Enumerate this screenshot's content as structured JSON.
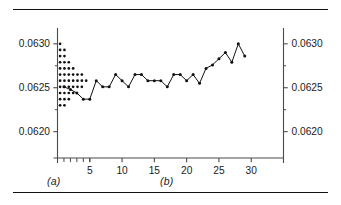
{
  "figure": {
    "panels": [
      {
        "id": "a",
        "label": "(a)",
        "type": "dotplot"
      },
      {
        "id": "b",
        "label": "(b)",
        "type": "line"
      }
    ]
  },
  "axes": {
    "left": {
      "tick_labels": [
        "0.0630",
        "0.0625",
        "0.0620"
      ],
      "tick_values": [
        0.063,
        0.0625,
        0.062
      ]
    },
    "right": {
      "tick_labels": [
        "0.0630",
        "0.0625",
        "0.0620"
      ],
      "tick_values": [
        0.063,
        0.0625,
        0.062
      ]
    },
    "bottom": {
      "tick_labels": [
        "5",
        "10",
        "15",
        "20",
        "25",
        "30"
      ],
      "tick_values": [
        5,
        10,
        15,
        20,
        25,
        30
      ],
      "minor_tick_values": [
        1,
        2,
        3,
        4,
        5
      ]
    },
    "ylim": [
      0.0617,
      0.06318
    ],
    "xlim": [
      0,
      35
    ]
  },
  "chart_data": {
    "type": "line",
    "title": "",
    "xlabel": "",
    "ylabel": "",
    "ylim": [
      0.0617,
      0.06318
    ],
    "xlim": [
      0,
      35
    ],
    "grid": false,
    "legend": "none",
    "panels": [
      {
        "id": "a",
        "label": "(a)",
        "type": "dotplot",
        "description": "Vertical dot plot (stacked dots) of the same measurements, one dot per observation binned by value.",
        "bins": [
          {
            "value": 0.063,
            "count": 1
          },
          {
            "value": 0.06293,
            "count": 2
          },
          {
            "value": 0.06286,
            "count": 2
          },
          {
            "value": 0.06279,
            "count": 3
          },
          {
            "value": 0.06272,
            "count": 4
          },
          {
            "value": 0.06265,
            "count": 6
          },
          {
            "value": 0.06258,
            "count": 7
          },
          {
            "value": 0.06251,
            "count": 6
          },
          {
            "value": 0.06244,
            "count": 4
          },
          {
            "value": 0.06237,
            "count": 3
          },
          {
            "value": 0.0623,
            "count": 2
          }
        ]
      },
      {
        "id": "b",
        "label": "(b)",
        "type": "line",
        "description": "Run chart / individuals chart of 29 sequential measurements with markers.",
        "x": [
          1,
          2,
          3,
          4,
          5,
          6,
          7,
          8,
          9,
          10,
          11,
          12,
          13,
          14,
          15,
          16,
          17,
          18,
          19,
          20,
          21,
          22,
          23,
          24,
          25,
          26,
          27,
          28,
          29
        ],
        "values": [
          0.06251,
          0.06248,
          0.06244,
          0.06237,
          0.06237,
          0.06258,
          0.06251,
          0.06251,
          0.06265,
          0.06258,
          0.06251,
          0.06265,
          0.06265,
          0.06258,
          0.06258,
          0.06258,
          0.06251,
          0.06265,
          0.06265,
          0.06258,
          0.06265,
          0.06255,
          0.06272,
          0.06276,
          0.06283,
          0.0629,
          0.06279,
          0.063,
          0.06286
        ]
      }
    ]
  },
  "icons": {}
}
